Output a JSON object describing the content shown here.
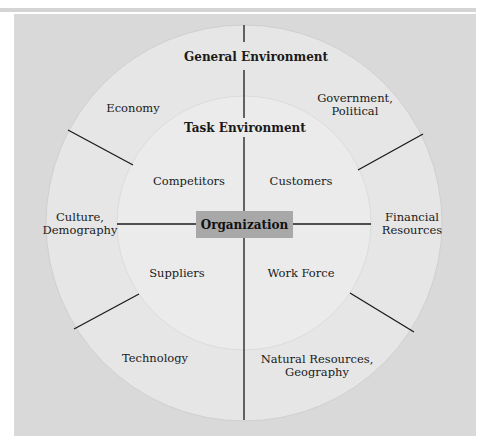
{
  "diagram": {
    "title": "General Environment",
    "inner_title": "Task Environment",
    "center": "Organization",
    "general_environment": [
      {
        "label": "Economy"
      },
      {
        "label": "Government,\nPolitical",
        "line1": "Government,",
        "line2": "Political"
      },
      {
        "label": "Culture,\nDemography",
        "line1": "Culture,",
        "line2": "Demography"
      },
      {
        "label": "Financial\nResources",
        "line1": "Financial",
        "line2": "Resources"
      },
      {
        "label": "Technology"
      },
      {
        "label": "Natural Resources,\nGeography",
        "line1": "Natural Resources,",
        "line2": "Geography"
      }
    ],
    "task_environment": [
      {
        "label": "Competitors"
      },
      {
        "label": "Customers"
      },
      {
        "label": "Suppliers"
      },
      {
        "label": "Work Force"
      }
    ],
    "colors": {
      "background": "#d9d9d9",
      "outer_ring": "#e6e6e6",
      "inner_circle": "#ebebeb",
      "center_box": "#a8a8a8",
      "lines": "#1a1a1a"
    }
  }
}
